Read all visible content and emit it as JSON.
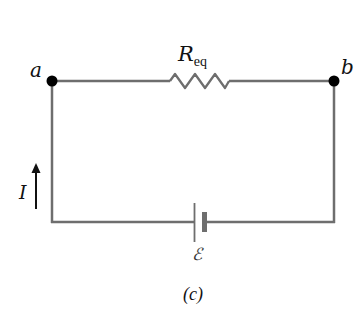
{
  "diagram": {
    "type": "circuit",
    "caption": "(c)",
    "nodes": [
      {
        "id": "a",
        "label": "a"
      },
      {
        "id": "b",
        "label": "b"
      }
    ],
    "components": [
      {
        "type": "resistor",
        "label_main": "R",
        "label_sub": "eq",
        "between": [
          "a",
          "b"
        ]
      },
      {
        "type": "battery",
        "label": "ℰ"
      }
    ],
    "current": {
      "label": "I",
      "direction": "up"
    },
    "colors": {
      "wire": "#6e6e6e",
      "node": "#000000",
      "text": "#111111"
    }
  }
}
